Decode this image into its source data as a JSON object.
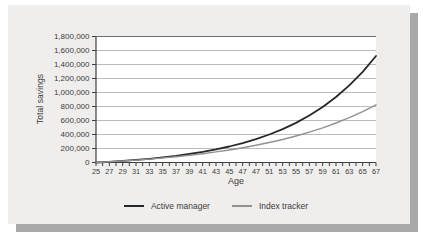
{
  "card": {
    "background": "#f0eeec",
    "shadow_color": "#a9a9a9"
  },
  "chart_data": {
    "type": "line",
    "title": "",
    "xlabel": "Age",
    "ylabel": "Total savings",
    "grid": "horizontal",
    "legend_position": "bottom",
    "ylim": [
      0,
      1800000
    ],
    "y_tick_step": 200000,
    "y_tick_labels_top_to_bottom": [
      "1,800,000",
      "1,600,000",
      "1,400,000",
      "1,200,000",
      "1,000,000",
      "800,000",
      "600,000",
      "400,000",
      "200,000",
      "0"
    ],
    "x_tick_labels": [
      "25",
      "27",
      "29",
      "31",
      "33",
      "35",
      "37",
      "39",
      "41",
      "43",
      "45",
      "47",
      "47",
      "51",
      "53",
      "55",
      "57",
      "59",
      "61",
      "63",
      "65",
      "67"
    ],
    "series": [
      {
        "name": "Active manager",
        "color": "#26282a",
        "stroke_width": 1.8,
        "values": [
          0,
          10400,
          22500,
          36700,
          53200,
          72400,
          94900,
          121100,
          151600,
          187300,
          228800,
          277300,
          333800,
          399800,
          476700,
          566400,
          671100,
          793100,
          935500,
          1101600,
          1295300,
          1521200
        ]
      },
      {
        "name": "Index tracker",
        "color": "#8f9193",
        "stroke_width": 1.4,
        "values": [
          0,
          10300,
          21800,
          34700,
          49100,
          65100,
          83100,
          103300,
          125800,
          150900,
          179100,
          210600,
          245700,
          285100,
          329100,
          378400,
          433400,
          495000,
          563800,
          640800,
          726900,
          823100
        ]
      }
    ]
  }
}
